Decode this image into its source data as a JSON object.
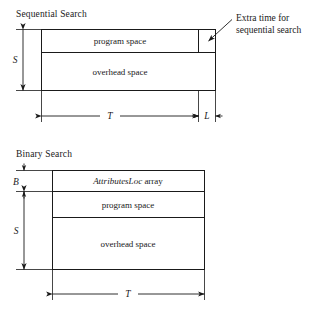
{
  "figure": {
    "title_present": false,
    "background_color": "#ffffff",
    "ink_color": "#1a1a1a"
  },
  "sections": [
    {
      "id": "sequential",
      "label": "Sequential Search",
      "bars": [
        {
          "id": "program-space",
          "label": "program space"
        },
        {
          "id": "overhead-space",
          "label": "overhead space"
        },
        {
          "id": "extra-time-cell",
          "label": ""
        }
      ],
      "dimensions": [
        {
          "id": "S",
          "label": "S",
          "orientation": "vertical"
        },
        {
          "id": "T",
          "label": "T",
          "orientation": "horizontal"
        },
        {
          "id": "L",
          "label": "L",
          "orientation": "horizontal"
        }
      ],
      "callout": {
        "id": "extra-time-callout",
        "line1": "Extra time for",
        "line2": "sequential search"
      }
    },
    {
      "id": "binary",
      "label": "Binary Search",
      "bars": [
        {
          "id": "attributesloc-array",
          "label_italic": "AttributesLoc",
          "label_roman": " array"
        },
        {
          "id": "program-space",
          "label": "program space"
        },
        {
          "id": "overhead-space",
          "label": "overhead space"
        }
      ],
      "dimensions": [
        {
          "id": "B",
          "label": "B",
          "orientation": "vertical"
        },
        {
          "id": "S",
          "label": "S",
          "orientation": "vertical"
        },
        {
          "id": "T",
          "label": "T",
          "orientation": "horizontal"
        }
      ]
    }
  ]
}
